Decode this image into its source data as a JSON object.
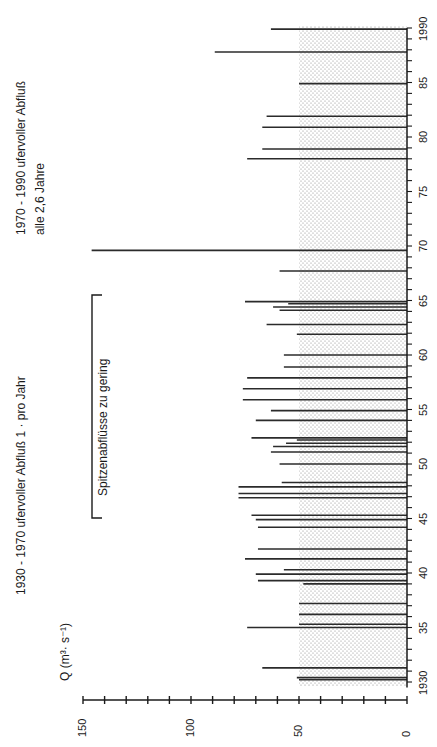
{
  "chart_data": {
    "type": "bar",
    "orientation": "rotated 90° counter-clockwise (years on right edge, discharge axis along bottom)",
    "title": "",
    "xlabel": "Jahr",
    "ylabel": "Q (m³·s⁻¹)",
    "ylim": [
      0,
      150
    ],
    "yticks": [
      0,
      50,
      100,
      150
    ],
    "yminor_step": 10,
    "xlim": [
      1930,
      1990
    ],
    "xticks": [
      "1930",
      "35",
      "40",
      "45",
      "50",
      "55",
      "60",
      "65",
      "70",
      "75",
      "80",
      "85",
      "1990"
    ],
    "bankfull_threshold": 50,
    "shaded_band": {
      "from": 0,
      "to": 50,
      "label": "bankfull discharge zone (stippled)"
    },
    "annotations": [
      {
        "text": "1930 - 1970 ufervoller Abfluß 1 · pro Jahr",
        "position": "left, lower half"
      },
      {
        "text": "1970 - 1990 ufervoller Abfluß",
        "position": "left, upper half"
      },
      {
        "text": "alle 2,6 Jahre",
        "position": "left, upper half"
      },
      {
        "text": "Spitzenabflüsse zu gering",
        "position": "bracket spanning ~1945–1965"
      }
    ],
    "points": [
      {
        "year": 1930.2,
        "value": 50
      },
      {
        "year": 1930.4,
        "value": 51
      },
      {
        "year": 1931.3,
        "value": 67
      },
      {
        "year": 1935.0,
        "value": 74
      },
      {
        "year": 1935.3,
        "value": 50
      },
      {
        "year": 1936.2,
        "value": 50
      },
      {
        "year": 1937.2,
        "value": 50
      },
      {
        "year": 1939.0,
        "value": 48
      },
      {
        "year": 1939.3,
        "value": 69
      },
      {
        "year": 1939.9,
        "value": 70
      },
      {
        "year": 1940.3,
        "value": 57
      },
      {
        "year": 1941.3,
        "value": 75
      },
      {
        "year": 1942.2,
        "value": 69
      },
      {
        "year": 1944.2,
        "value": 69
      },
      {
        "year": 1944.9,
        "value": 70
      },
      {
        "year": 1945.3,
        "value": 72
      },
      {
        "year": 1946.9,
        "value": 78
      },
      {
        "year": 1947.3,
        "value": 78
      },
      {
        "year": 1947.9,
        "value": 78
      },
      {
        "year": 1948.3,
        "value": 58
      },
      {
        "year": 1950.0,
        "value": 59
      },
      {
        "year": 1951.1,
        "value": 63
      },
      {
        "year": 1951.6,
        "value": 62
      },
      {
        "year": 1951.9,
        "value": 56
      },
      {
        "year": 1952.2,
        "value": 51
      },
      {
        "year": 1952.4,
        "value": 72
      },
      {
        "year": 1954.0,
        "value": 70
      },
      {
        "year": 1954.9,
        "value": 63
      },
      {
        "year": 1955.9,
        "value": 76
      },
      {
        "year": 1956.9,
        "value": 76
      },
      {
        "year": 1957.9,
        "value": 74
      },
      {
        "year": 1958.9,
        "value": 57
      },
      {
        "year": 1960.0,
        "value": 57
      },
      {
        "year": 1961.9,
        "value": 51
      },
      {
        "year": 1962.8,
        "value": 65
      },
      {
        "year": 1964.1,
        "value": 59
      },
      {
        "year": 1964.4,
        "value": 62
      },
      {
        "year": 1964.7,
        "value": 55
      },
      {
        "year": 1964.9,
        "value": 75
      },
      {
        "year": 1967.7,
        "value": 59
      },
      {
        "year": 1969.6,
        "value": 146
      },
      {
        "year": 1978.0,
        "value": 74
      },
      {
        "year": 1978.9,
        "value": 67
      },
      {
        "year": 1980.9,
        "value": 67
      },
      {
        "year": 1981.9,
        "value": 65
      },
      {
        "year": 1984.9,
        "value": 50
      },
      {
        "year": 1987.8,
        "value": 89
      },
      {
        "year": 1989.9,
        "value": 63
      }
    ]
  },
  "labels": {
    "y_axis_title": "Q (m³· s⁻¹)",
    "annotation_1930_1970": "1930 - 1970 ufervoller Abfluß 1 · pro Jahr",
    "annotation_1970_1990_line1": "1970 - 1990 ufervoller Abfluß",
    "annotation_1970_1990_line2": "alle 2,6 Jahre",
    "bracket_label": "Spitzenabflüsse zu gering"
  },
  "style": {
    "bar_color": "#2b2b2b",
    "axis_color": "#1a1a1a",
    "stipple_color": "#9a9a9a"
  }
}
